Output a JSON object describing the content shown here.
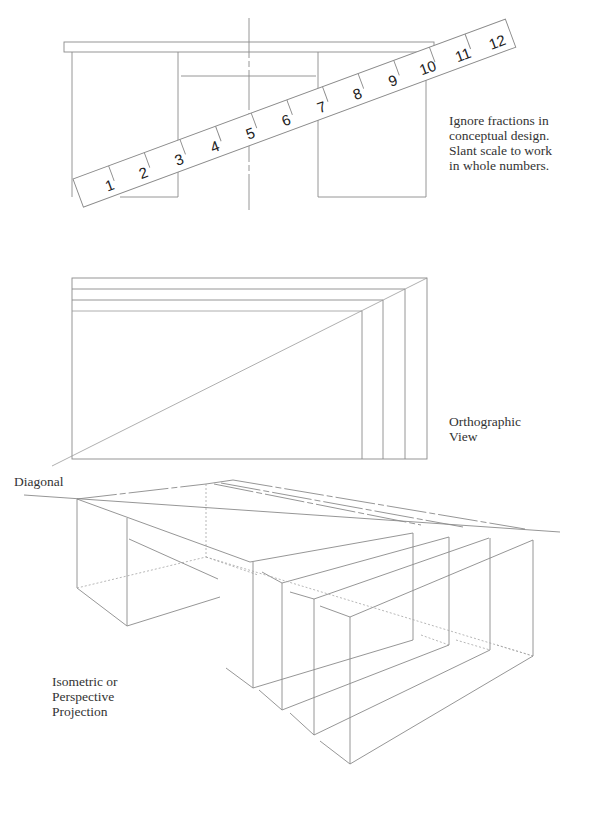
{
  "figure": {
    "sections": [
      {
        "id": "scale-section",
        "caption_lines": [
          "Ignore fractions in",
          "conceptual design.",
          "Slant scale to work",
          "in whole numbers."
        ]
      },
      {
        "id": "orthographic-section",
        "caption_lines": [
          "Orthographic",
          "View"
        ]
      },
      {
        "id": "diagonal-label",
        "label": "Diagonal"
      },
      {
        "id": "projection-section",
        "caption_lines": [
          "Isometric or",
          "Perspective",
          "Projection"
        ]
      }
    ],
    "scale": {
      "numbers": [
        "1",
        "2",
        "3",
        "4",
        "5",
        "6",
        "7",
        "8",
        "9",
        "10",
        "11",
        "12"
      ]
    }
  }
}
